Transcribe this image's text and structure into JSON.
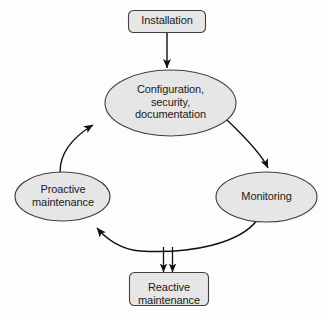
{
  "diagram": {
    "type": "cycle-flowchart",
    "background_color": "#fdfdfd",
    "shape_fill_color": "#e6e6e6",
    "shape_stroke_color": "#404040",
    "text_color": "#1a1a1a",
    "nodes": [
      {
        "id": "installation",
        "shape": "rounded-rectangle",
        "lines": [
          "Installation"
        ]
      },
      {
        "id": "configuration",
        "shape": "ellipse",
        "lines": [
          "Configuration,",
          "security,",
          "documentation"
        ]
      },
      {
        "id": "monitoring",
        "shape": "ellipse",
        "lines": [
          "Monitoring"
        ]
      },
      {
        "id": "proactive",
        "shape": "ellipse",
        "lines": [
          "Proactive",
          "maintenance"
        ]
      },
      {
        "id": "reactive",
        "shape": "rounded-rectangle",
        "lines": [
          "Reactive",
          "maintenance"
        ]
      }
    ],
    "edges": [
      {
        "id": "installation-to-configuration",
        "from": "installation",
        "to": "configuration",
        "style": "straight-arrow"
      },
      {
        "id": "configuration-to-monitoring",
        "from": "configuration",
        "to": "monitoring",
        "style": "curved-arrow"
      },
      {
        "id": "monitoring-to-proactive",
        "from": "monitoring",
        "to": "proactive",
        "style": "curved-arrow"
      },
      {
        "id": "monitoring-to-reactive",
        "from": "monitoring",
        "to": "reactive",
        "style": "straight-arrow"
      },
      {
        "id": "proactive-to-reactive",
        "from": "proactive",
        "to": "reactive",
        "style": "straight-arrow"
      },
      {
        "id": "proactive-to-configuration",
        "from": "proactive",
        "to": "configuration",
        "style": "curved-arrow"
      }
    ]
  }
}
